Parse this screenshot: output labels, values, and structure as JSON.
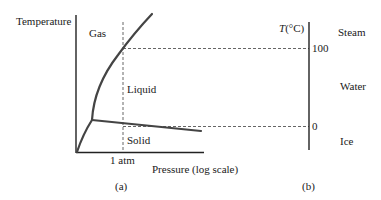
{
  "panel_a": {
    "y_axis_label": "Temperature",
    "x_axis_label": "Pressure (log scale)",
    "x_tick_label": "1 atm",
    "regions": {
      "gas": "Gas",
      "liquid": "Liquid",
      "solid": "Solid"
    },
    "caption": "(a)"
  },
  "panel_b": {
    "axis_label_var": "T",
    "axis_label_unit": "(°C)",
    "ticks": {
      "boiling": "100",
      "freezing": "0"
    },
    "phases": {
      "steam": "Steam",
      "water": "Water",
      "ice": "Ice"
    },
    "caption": "(b)"
  },
  "colors": {
    "curve": "#444444",
    "axis": "#222222",
    "dash": "#555555",
    "text": "#1a1a1a"
  }
}
